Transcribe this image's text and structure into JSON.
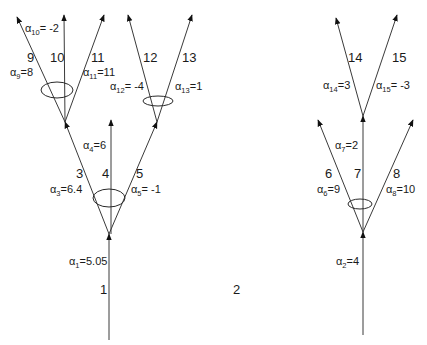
{
  "diagram": {
    "trees": [
      {
        "id": "tree-1",
        "edges": [
          {
            "index": "1",
            "alpha_sub": "1",
            "alpha_value": "=5.05"
          },
          {
            "index": "3",
            "alpha_sub": "3",
            "alpha_value": "=6.4"
          },
          {
            "index": "4",
            "alpha_sub": "4",
            "alpha_value": "=6"
          },
          {
            "index": "5",
            "alpha_sub": "5",
            "alpha_value": "= -1"
          },
          {
            "index": "9",
            "alpha_sub": "9",
            "alpha_value": "=8"
          },
          {
            "index": "10",
            "alpha_sub": "10",
            "alpha_value": "= -2"
          },
          {
            "index": "11",
            "alpha_sub": "11",
            "alpha_value": "=11"
          },
          {
            "index": "12",
            "alpha_sub": "12",
            "alpha_value": "= -4"
          },
          {
            "index": "13",
            "alpha_sub": "13",
            "alpha_value": "=1"
          }
        ]
      },
      {
        "id": "tree-2",
        "label": "2",
        "edges": [
          {
            "index": "2",
            "alpha_sub": "2",
            "alpha_value": "=4"
          },
          {
            "index": "6",
            "alpha_sub": "6",
            "alpha_value": "=9"
          },
          {
            "index": "7",
            "alpha_sub": "7",
            "alpha_value": "=2"
          },
          {
            "index": "8",
            "alpha_sub": "8",
            "alpha_value": "=10"
          },
          {
            "index": "14",
            "alpha_sub": "14",
            "alpha_value": "=3"
          },
          {
            "index": "15",
            "alpha_sub": "15",
            "alpha_value": "= -3"
          }
        ]
      }
    ],
    "alpha_symbol": "α",
    "colors": {
      "line": "#3a3a3a",
      "text": "#1a1a1a",
      "background": "#ffffff"
    }
  }
}
